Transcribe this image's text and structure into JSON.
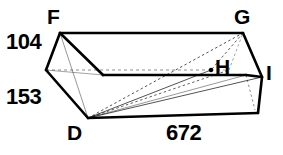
{
  "figure": {
    "type": "rectangular-prism-oblique",
    "vertices": [
      {
        "id": "F",
        "label": "F",
        "x": 60,
        "y": 33
      },
      {
        "id": "G",
        "label": "G",
        "x": 243,
        "y": 33
      },
      {
        "id": "H",
        "label": "H",
        "x": 211,
        "y": 70
      },
      {
        "id": "I",
        "label": "I",
        "x": 262,
        "y": 77
      },
      {
        "id": "D",
        "label": "D",
        "x": 88,
        "y": 118
      },
      {
        "id": "E",
        "label": "",
        "x": 46,
        "y": 70
      },
      {
        "id": "B",
        "label": "",
        "x": 258,
        "y": 113
      },
      {
        "id": "A",
        "label": "",
        "x": 229,
        "y": 70
      }
    ],
    "dimensions": [
      {
        "id": "height",
        "value": "104",
        "edge": "F-E"
      },
      {
        "id": "depth",
        "value": "153",
        "edge": "E-D"
      },
      {
        "id": "width",
        "value": "672",
        "edge": "D-B"
      }
    ],
    "stroke_color": "#000000",
    "background_color": "#ffffff",
    "solid_line_width": 2.6,
    "thin_line_width": 0.8,
    "hidden_line_width": 0.8,
    "hidden_dash": "3,3"
  }
}
